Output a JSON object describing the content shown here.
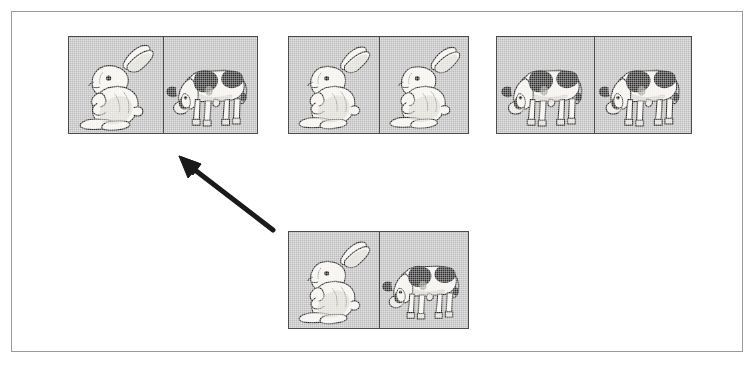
{
  "figure": {
    "kind": "stimulus-panel",
    "frame": {
      "border_color": "#9a9a9a",
      "background_color": "#ffffff",
      "x": 11,
      "y": 11,
      "width": 732,
      "height": 341
    },
    "palette": {
      "card_background": "#bdbdbd",
      "card_border": "#4c4c4c",
      "arrow_color": "#1a1a1a",
      "animal_outline": "#2b2b2b",
      "animal_light": "#f3f1ec",
      "cow_patch": "#2f2f2f"
    },
    "cards": [
      {
        "id": "card-1",
        "position": "top-left",
        "x": 68,
        "y": 36,
        "width": 190,
        "height": 98,
        "cells": [
          {
            "index": 0,
            "content": "rabbit",
            "count": 1
          },
          {
            "index": 1,
            "content": "cow",
            "count": 1
          }
        ],
        "pair": "rabbit-cow"
      },
      {
        "id": "card-2",
        "position": "top-center",
        "x": 288,
        "y": 36,
        "width": 181,
        "height": 98,
        "cells": [
          {
            "index": 0,
            "content": "rabbit",
            "count": 1
          },
          {
            "index": 1,
            "content": "rabbit",
            "count": 1
          }
        ],
        "pair": "rabbit-rabbit"
      },
      {
        "id": "card-3",
        "position": "top-right",
        "x": 496,
        "y": 36,
        "width": 196,
        "height": 98,
        "cells": [
          {
            "index": 0,
            "content": "cow",
            "count": 1
          },
          {
            "index": 1,
            "content": "cow",
            "count": 1
          }
        ],
        "pair": "cow-cow"
      },
      {
        "id": "card-4",
        "position": "bottom-center",
        "x": 288,
        "y": 231,
        "width": 181,
        "height": 98,
        "cells": [
          {
            "index": 0,
            "content": "rabbit",
            "count": 1
          },
          {
            "index": 1,
            "content": "cow",
            "count": 1
          }
        ],
        "pair": "rabbit-cow"
      }
    ],
    "arrow": {
      "name": "selection-arrow",
      "from_x": 272,
      "from_y": 232,
      "to_x": 180,
      "to_y": 161,
      "points_to": "card-1",
      "direction": "up-left",
      "color": "#1a1a1a",
      "thickness": 5
    }
  }
}
